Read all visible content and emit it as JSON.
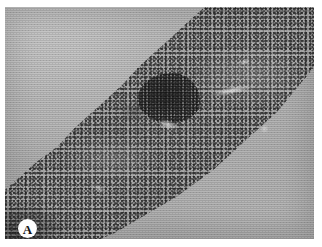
{
  "figure": {
    "panel_label": "A",
    "modality": "light-microscopy-histology",
    "stain_description": "grayscale reproduction of haematoxylin-stained tissue section",
    "caption_text": ""
  },
  "plate": {
    "width_px": 309,
    "height_px": 232,
    "margin_left_px": 5,
    "margin_top_px": 7,
    "page_background_color": "#ffffff",
    "background_color": "#a9a9a9",
    "tissue_color": "#9d9d9d",
    "nuclei_color": "#1e1e1e",
    "nodule_color": "#2c2c2c",
    "cleft_color": "#e2e2e2",
    "label_circle_color": "#fdfdfd",
    "label_text_color": "#141414"
  },
  "features": [
    {
      "name": "cellular-tissue-band",
      "description": "dense hypercellular band running diagonally from lower-left to upper-right across the field",
      "orientation": "lower-left to upper-right"
    },
    {
      "name": "dark-nodular-aggregate",
      "description": "darker densely packed nodular cell cluster in the upper-central portion of the band",
      "position": "upper-centre"
    },
    {
      "name": "pale-cleft",
      "description": "elongated pale linear clefts and small pale spaces within the cellular band"
    },
    {
      "name": "empty-slide-background",
      "description": "pale homogeneous acellular background occupying the upper-left and lower-right corners"
    },
    {
      "name": "corner-dark-condensation",
      "description": "darker densely stained tissue fragment at the lower-left corner"
    }
  ]
}
